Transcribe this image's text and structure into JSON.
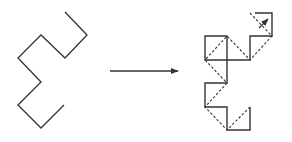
{
  "diagram": {
    "colors": {
      "stroke": "#333333",
      "background": "#ffffff"
    },
    "left_shape": {
      "points": "65,12 87,35 65,58 41,35 18,58 41,82 18,105 41,128 64,105"
    },
    "arrow": {
      "x1": 110,
      "y1": 71,
      "x2": 178,
      "y2": 71
    },
    "right_shape": {
      "solid_path": "M255,13 L272,13 L272,36 L250,36 L250,60 L205,60 L205,36 L227,36 L227,83 L205,83 L205,107 L227,107 L227,130 L250,130 L250,107",
      "dashed_path": "M250,13 L272,36 L250,60 L227,36 L205,60 L227,83 L205,107 L227,130 L250,107",
      "small_arrow": {
        "x1": 259,
        "y1": 28,
        "x2": 268,
        "y2": 19
      }
    }
  }
}
